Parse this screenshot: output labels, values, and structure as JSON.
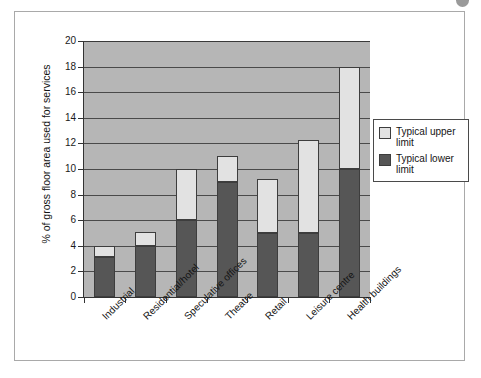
{
  "chart_data": {
    "type": "bar",
    "subtype": "stacked-range",
    "title": "",
    "xlabel": "",
    "ylabel": "% of gross floor area used for services",
    "ylim": [
      0,
      20
    ],
    "ytick_step": 2,
    "yticks": [
      0,
      2,
      4,
      6,
      8,
      10,
      12,
      14,
      16,
      18,
      20
    ],
    "grid": "horizontal",
    "legend_position": "right",
    "categories": [
      "Industrial",
      "Residential/hotel",
      "Speculative offices",
      "Theatre",
      "Retail",
      "Leisure centre",
      "Health buildings"
    ],
    "series": [
      {
        "name": "Typical lower limit",
        "color": "#565656",
        "values": [
          3.1,
          4.0,
          6.0,
          9.0,
          5.0,
          5.0,
          10.0
        ]
      },
      {
        "name": "Typical upper limit",
        "color": "#e2e2e2",
        "values": [
          4.0,
          5.1,
          10.0,
          11.0,
          9.2,
          12.3,
          18.0
        ]
      }
    ]
  },
  "legend": {
    "entries": [
      {
        "label": "Typical upper limit",
        "color": "#e2e2e2"
      },
      {
        "label": "Typical lower limit",
        "color": "#565656"
      }
    ]
  },
  "colors": {
    "plot_background": "#b6b6b6",
    "gridline": "#4a4a4a",
    "axis": "#333333",
    "upper_limit": "#e2e2e2",
    "lower_limit": "#565656",
    "frame_border": "#a9a9a9",
    "corner_dot": "#9a9a9a"
  }
}
